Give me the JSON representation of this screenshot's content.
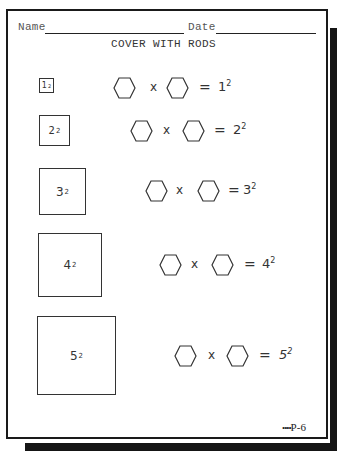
{
  "header": {
    "name_label": "Name",
    "date_label": "Date",
    "title": "COVER WITH RODS"
  },
  "squares": [
    {
      "base": "1",
      "exp": "2"
    },
    {
      "base": "2",
      "exp": "2"
    },
    {
      "base": "3",
      "exp": "2"
    },
    {
      "base": "4",
      "exp": "2"
    },
    {
      "base": "5",
      "exp": "2"
    }
  ],
  "equations": [
    {
      "times": "x",
      "equals": "=",
      "base": "1",
      "exp": "2"
    },
    {
      "times": "x",
      "equals": "=",
      "base": "2",
      "exp": "2"
    },
    {
      "times": "x",
      "equals": "=",
      "base": "3",
      "exp": "2"
    },
    {
      "times": "x",
      "equals": "=",
      "base": "4",
      "exp": "2"
    },
    {
      "times": "x",
      "equals": "=",
      "base": "5",
      "exp": "2"
    }
  ],
  "icons": {
    "blank": "hexagon-answer-blank-icon"
  },
  "footer": {
    "dots": "••••",
    "page_code": "P-6"
  }
}
